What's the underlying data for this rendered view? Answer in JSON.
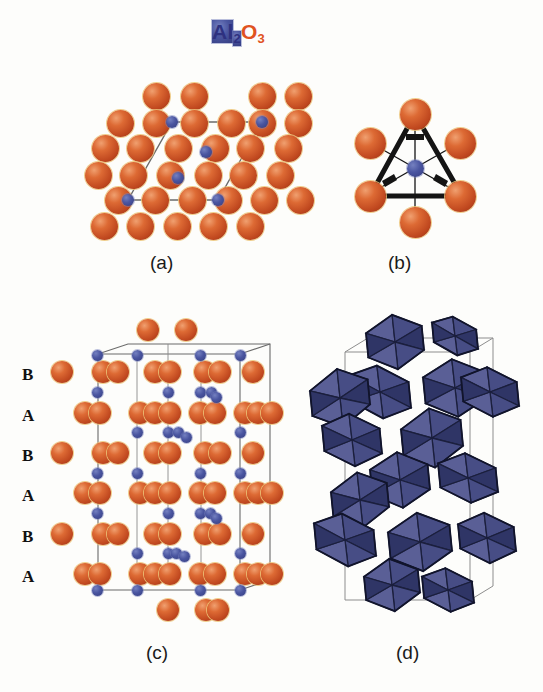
{
  "figure": {
    "title": {
      "element_1": "Al",
      "sub_1": "2",
      "element_2": "O",
      "sub_2": "3"
    },
    "compound_name": "Al2O3",
    "background_color": "#fdfdfb",
    "width": 543,
    "height": 692
  },
  "colors": {
    "oxygen": "#c8502a",
    "oxygen_highlight": "#f0a070",
    "oxygen_rim": "#ecc478",
    "aluminum": "#3b4a8c",
    "aluminum_highlight": "#7480c0",
    "octahedron_face_light": "#5a5f96",
    "octahedron_face_mid": "#474d85",
    "octahedron_face_dark": "#2f3566",
    "cell_line": "#6b6b6b",
    "bond_line": "#111111",
    "title_al": "#2e3180",
    "title_o": "#e0531f"
  },
  "panels": [
    {
      "id": "a",
      "caption": "(a)",
      "description": "basal plane projection of corundum with hexagonal unit cell outline"
    },
    {
      "id": "b",
      "caption": "(b)",
      "description": "single AlO6 octahedral coordination unit"
    },
    {
      "id": "c",
      "caption": "(c)",
      "description": "side view showing ABAB oxygen stacking sequence with unit cell box"
    },
    {
      "id": "d",
      "caption": "(d)",
      "description": "polyhedral representation of edge and face sharing AlO6 octahedra"
    }
  ],
  "stacking_labels": [
    "B",
    "A",
    "B",
    "A",
    "B",
    "A"
  ],
  "legend": {
    "oxygen_label": "O",
    "aluminum_label": "Al"
  }
}
